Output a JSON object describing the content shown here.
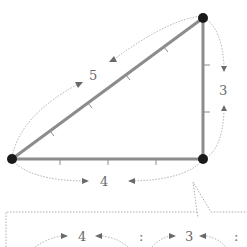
{
  "diagram": {
    "colors": {
      "side": "#8c8c8c",
      "vertex": "#1a1a1a",
      "label": "#6a6a6a",
      "dashed": "#9a9a9a"
    },
    "vertices": [
      {
        "name": "top-right",
        "x": 203,
        "y": 18
      },
      {
        "name": "bottom-left",
        "x": 12,
        "y": 159
      },
      {
        "name": "bottom-right",
        "x": 203,
        "y": 159
      }
    ],
    "sides": [
      {
        "name": "hypotenuse",
        "length_label": "5",
        "ticks": 4
      },
      {
        "name": "vertical-leg",
        "length_label": "3",
        "ticks": 2
      },
      {
        "name": "horizontal-leg",
        "length_label": "4",
        "ticks": 3
      }
    ],
    "callout": {
      "ratio_items": [
        "4",
        ":",
        "3",
        ":"
      ]
    }
  }
}
